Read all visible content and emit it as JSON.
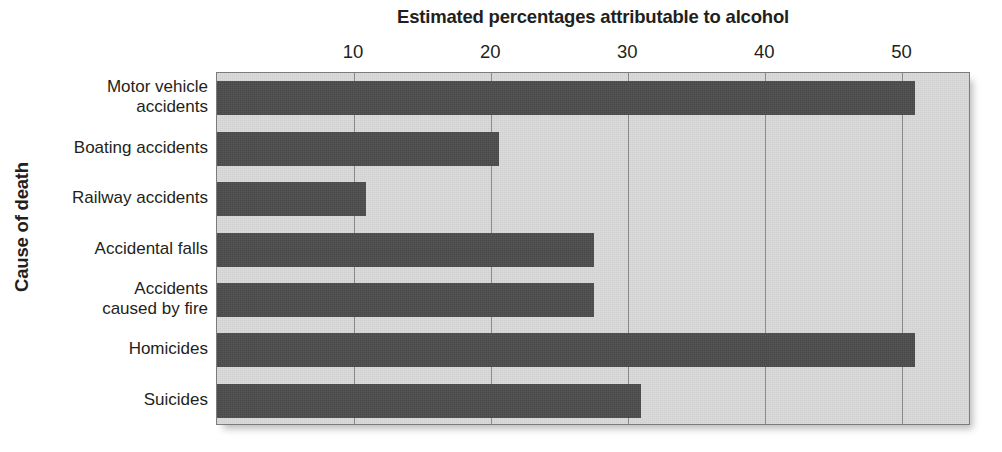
{
  "chart_data": {
    "type": "bar",
    "orientation": "horizontal",
    "title": "Estimated percentages attributable to alcohol",
    "xlabel": "Estimated percentages attributable to alcohol",
    "ylabel": "Cause of death",
    "xlim": [
      0,
      55
    ],
    "xticks": [
      10,
      20,
      30,
      40,
      50
    ],
    "xtick_labels": [
      "10",
      "20",
      "30",
      "40",
      "50"
    ],
    "grid": true,
    "legend": "none",
    "categories": [
      "Motor vehicle accidents",
      "Boating accidents",
      "Railway accidents",
      "Accidental falls",
      "Accidents caused by fire",
      "Homicides",
      "Suicides"
    ],
    "category_label_lines": [
      [
        "Motor vehicle",
        "accidents"
      ],
      [
        "Boating accidents"
      ],
      [
        "Railway accidents"
      ],
      [
        "Accidental falls"
      ],
      [
        "Accidents",
        "caused by fire"
      ],
      [
        "Homicides"
      ],
      [
        "Suicides"
      ]
    ],
    "values": [
      50.9,
      20.6,
      10.9,
      27.5,
      27.5,
      50.9,
      30.9
    ],
    "bar_color": "#4a4a4a",
    "plot_background": "#d9d9d9",
    "gridline_color": "#8a8a8a",
    "axis_border_color": "#7b7b7b",
    "page_background": "#ffffff",
    "text_color": "#231f20"
  }
}
